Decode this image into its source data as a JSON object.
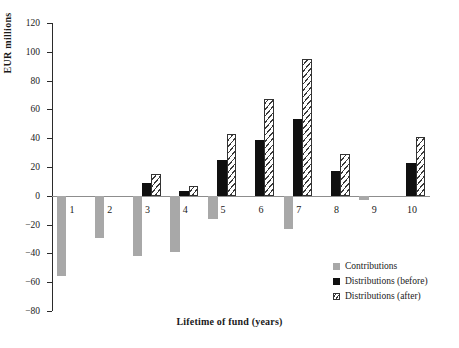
{
  "chart_data": {
    "type": "bar",
    "title": "",
    "xlabel": "Lifetime of fund (years)",
    "ylabel": "EUR millions",
    "categories": [
      "1",
      "2",
      "3",
      "4",
      "5",
      "6",
      "7",
      "8",
      "9",
      "10"
    ],
    "ylim": [
      -80,
      120
    ],
    "yticks": [
      120,
      100,
      80,
      60,
      40,
      20,
      0,
      -20,
      -40,
      -60,
      -80
    ],
    "ytick_labels": [
      "120",
      "100",
      "80",
      "60",
      "40",
      "20",
      "0",
      "−20",
      "−40",
      "−60",
      "−80"
    ],
    "grid": false,
    "legend_position": "bottom-right",
    "series": [
      {
        "name": "Contributions",
        "color": "#a8a8a8",
        "fill": "solid",
        "values": [
          -56,
          -29,
          -42,
          -39,
          -16,
          0,
          -23,
          0,
          -3,
          0
        ]
      },
      {
        "name": "Distributions (before)",
        "color": "#101010",
        "fill": "solid",
        "values": [
          0,
          0,
          9,
          3,
          25,
          39,
          53,
          17,
          0,
          23
        ]
      },
      {
        "name": "Distributions (after)",
        "color": "#ffffff",
        "fill": "hatched",
        "values": [
          0,
          0,
          15,
          7,
          43,
          67,
          95,
          29,
          0,
          41
        ]
      }
    ]
  },
  "legend": {
    "items": [
      {
        "label": "Contributions",
        "swatch": "swatch-gray-solid"
      },
      {
        "label": "Distributions (before)",
        "swatch": "swatch-black-solid"
      },
      {
        "label": "Distributions (after)",
        "swatch": "swatch-hatched"
      }
    ]
  }
}
